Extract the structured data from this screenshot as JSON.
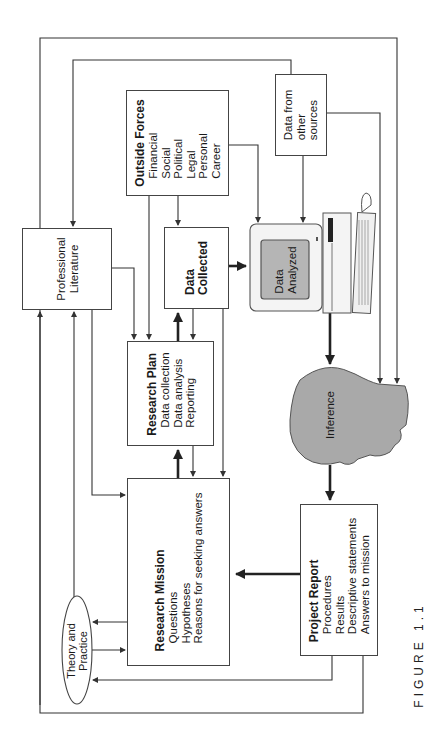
{
  "figure": {
    "caption": "FIGURE 1.1"
  },
  "nodes": {
    "outside_forces": {
      "title": "Outside Forces",
      "items": [
        "Financial",
        "Social",
        "Political",
        "Legal",
        "Personal",
        "Career"
      ]
    },
    "data_other_sources": {
      "lines": [
        "Data from",
        "other",
        "sources"
      ]
    },
    "professional_literature": {
      "lines": [
        "Professional",
        "Literature"
      ]
    },
    "data_collected": {
      "lines": [
        "Data",
        "Collected"
      ]
    },
    "data_analyzed": {
      "lines": [
        "Data",
        "Analyzed"
      ]
    },
    "research_plan": {
      "title": "Research Plan",
      "items": [
        "Data collection",
        "Data analysis",
        "Reporting"
      ]
    },
    "inference": {
      "label": "Inference"
    },
    "research_mission": {
      "title": "Research Mission",
      "items": [
        "Questions",
        "Hypotheses",
        "Reasons for seeking answers"
      ]
    },
    "project_report": {
      "title": "Project Report",
      "items": [
        "Procedures",
        "Results",
        "Descriptive statements",
        "Answers to mission"
      ]
    },
    "theory_practice": {
      "lines": [
        "Theory and",
        "Practice"
      ]
    }
  },
  "colors": {
    "line": "#333333",
    "head_fill": "#a9a9a9",
    "screen_fill": "#b5b5b5",
    "box_border": "#444444"
  }
}
